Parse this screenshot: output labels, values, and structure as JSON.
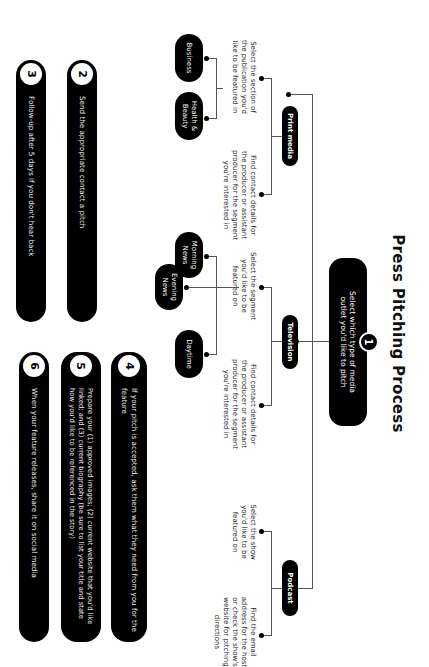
{
  "title": "Press Pitching Process",
  "step1": {
    "number": "1",
    "text": "Select which type of media outlet you'd like to pitch"
  },
  "outlets": [
    {
      "label": "Print media",
      "left_text": "Select the section of the publication you'd like to be featured in",
      "right_text": "Find contact details for the producer or assistant producer for the segment you're interested in",
      "options": [
        "Business",
        "Health & Beauty"
      ]
    },
    {
      "label": "Television",
      "left_text": "Select the segment you'd like to be featured on",
      "right_text": "Find contact details for the producer or assistant producer for the segment you're interested in",
      "options": [
        "Morning News",
        "Evening News",
        "Daytime"
      ]
    },
    {
      "label": "Podcast",
      "left_text": "Select the show you'd like to be featured on",
      "right_text": "Find the email address for the host or check the show's website for pitching directions"
    }
  ],
  "steps": [
    {
      "number": "2",
      "text": "Send the appropriate contact a pitch"
    },
    {
      "number": "3",
      "text": "Follow-up after 5 days if you don't hear back"
    },
    {
      "number": "4",
      "text": "If your pitch is accepted, ask them what they need from you for the feature"
    },
    {
      "number": "5",
      "text": "Prepare your (1) approved images; (2) current website that you'd like linked; and (3) current biography (be sure to list your title and state how you'd like to be referenced in the story)"
    },
    {
      "number": "6",
      "text": "When your feature releases, share it on social media"
    }
  ],
  "colors": {
    "node": "#000000",
    "background": "#ffffff",
    "connector": "#555555"
  }
}
